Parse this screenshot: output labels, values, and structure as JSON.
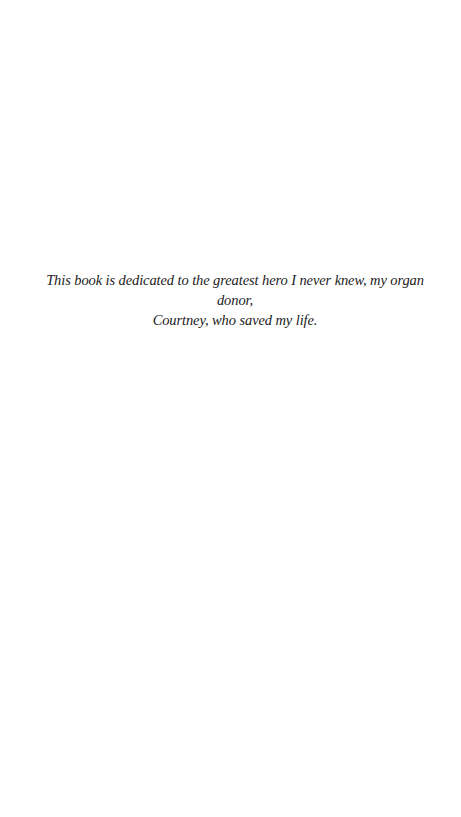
{
  "page": {
    "background": "#ffffff",
    "text_color": "#222222"
  },
  "dedication": {
    "line1": "This book is dedicated to the greatest hero I never knew, my organ donor,",
    "line2": "Courtney, who saved my life."
  }
}
